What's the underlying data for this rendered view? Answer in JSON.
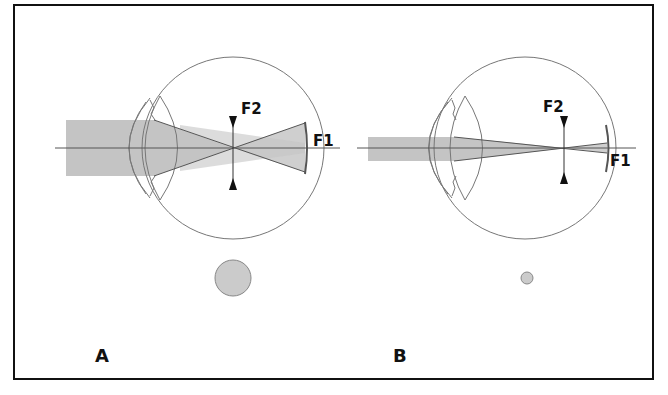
{
  "figure": {
    "panels": [
      {
        "id": "A",
        "label": "A",
        "focus_labels": {
          "f1": "F1",
          "f2": "F2"
        },
        "beam": "wide",
        "pupil": "large"
      },
      {
        "id": "B",
        "label": "B",
        "focus_labels": {
          "f1": "F1",
          "f2": "F2"
        },
        "beam": "narrow",
        "pupil": "small"
      }
    ]
  },
  "colors": {
    "beam": "#c4c4c4",
    "outline": "#777777",
    "ray": "#555555",
    "text": "#111111"
  }
}
